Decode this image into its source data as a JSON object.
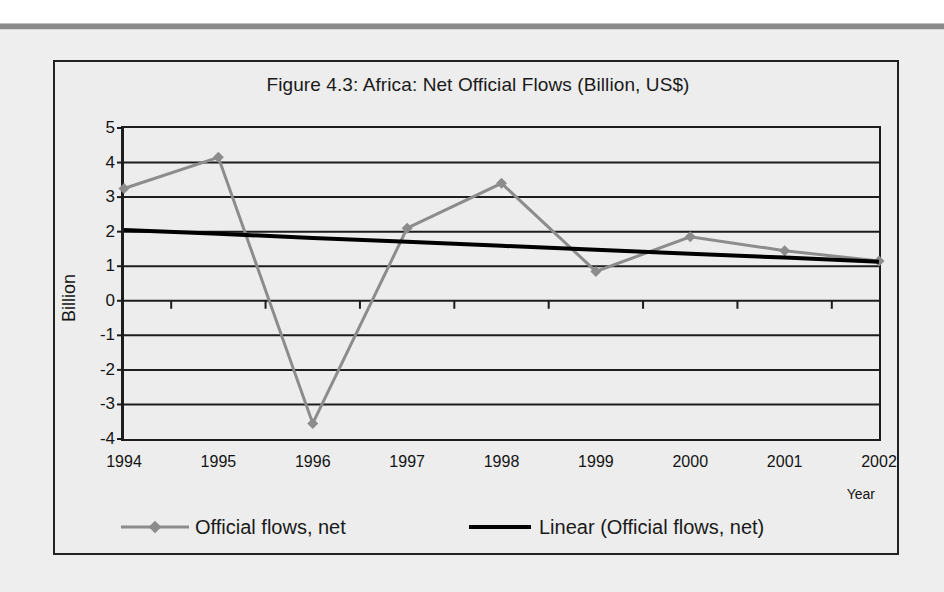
{
  "chart_data": {
    "type": "line",
    "title": "Figure 4.3: Africa: Net Official Flows (Billion, US$)",
    "xlabel": "Year",
    "ylabel": "Billion",
    "categories": [
      "1994",
      "1995",
      "1996",
      "1997",
      "1998",
      "1999",
      "2000",
      "2001",
      "2002"
    ],
    "ylim": [
      -4,
      5
    ],
    "ytick_step": 1,
    "yticks": [
      "5",
      "4",
      "3",
      "2",
      "1",
      "0",
      "-1",
      "-2",
      "-3",
      "-4"
    ],
    "grid": true,
    "legend_position": "bottom",
    "series": [
      {
        "name": "Official flows, net",
        "type": "line",
        "color": "#8c8c8c",
        "marker": "diamond",
        "values": [
          3.25,
          4.15,
          -3.55,
          2.1,
          3.4,
          0.85,
          1.85,
          1.45,
          1.15
        ]
      },
      {
        "name": "Linear (Official flows, net)",
        "type": "trendline",
        "color": "#000000",
        "marker": "none",
        "values": [
          2.05,
          1.94,
          1.82,
          1.71,
          1.59,
          1.48,
          1.36,
          1.25,
          1.13
        ]
      }
    ]
  },
  "legend": {
    "items": [
      {
        "label": "Official flows, net",
        "swatch": "gray-line-diamond-marker"
      },
      {
        "label": "Linear (Official flows, net)",
        "swatch": "black-line"
      }
    ]
  }
}
